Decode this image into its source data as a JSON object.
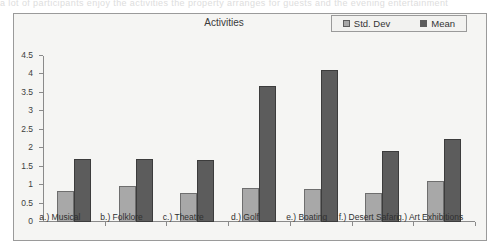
{
  "page": {
    "scan_top_text": "a lot of participants enjoy the activities the property arranges for guests and the evening entertainment"
  },
  "chart": {
    "title": "Activities",
    "legend": {
      "position": "top-right",
      "items": [
        {
          "label": "Std. Dev",
          "color": "#a8a8a8",
          "icon": "legend-swatch-std-dev"
        },
        {
          "label": "Mean",
          "color": "#5c5c5c",
          "icon": "legend-swatch-mean"
        }
      ]
    }
  },
  "chart_data": {
    "type": "bar",
    "title": "Activities",
    "xlabel": "",
    "ylabel": "",
    "ylim": [
      0,
      4.5
    ],
    "grid": false,
    "legend_position": "top-right",
    "categories": [
      "a.) Musical",
      "b.) Folklore",
      "c.) Theatre",
      "d.) Golf",
      "e.) Boating",
      "f.) Desert Safari",
      "g.) Art Exhibitions"
    ],
    "yticks": [
      "0",
      "0.5",
      "1",
      "1.5",
      "2",
      "2.5",
      "3",
      "3.5",
      "4",
      "4.5"
    ],
    "ytick_values": [
      0,
      0.5,
      1,
      1.5,
      2,
      2.5,
      3,
      3.5,
      4,
      4.5
    ],
    "series": [
      {
        "name": "Std. Dev",
        "color": "#a8a8a8",
        "values": [
          0.83,
          0.97,
          0.78,
          0.92,
          0.89,
          0.78,
          1.11
        ]
      },
      {
        "name": "Mean",
        "color": "#5c5c5c",
        "values": [
          1.72,
          1.72,
          1.67,
          3.7,
          4.11,
          1.92,
          2.25
        ]
      }
    ]
  }
}
